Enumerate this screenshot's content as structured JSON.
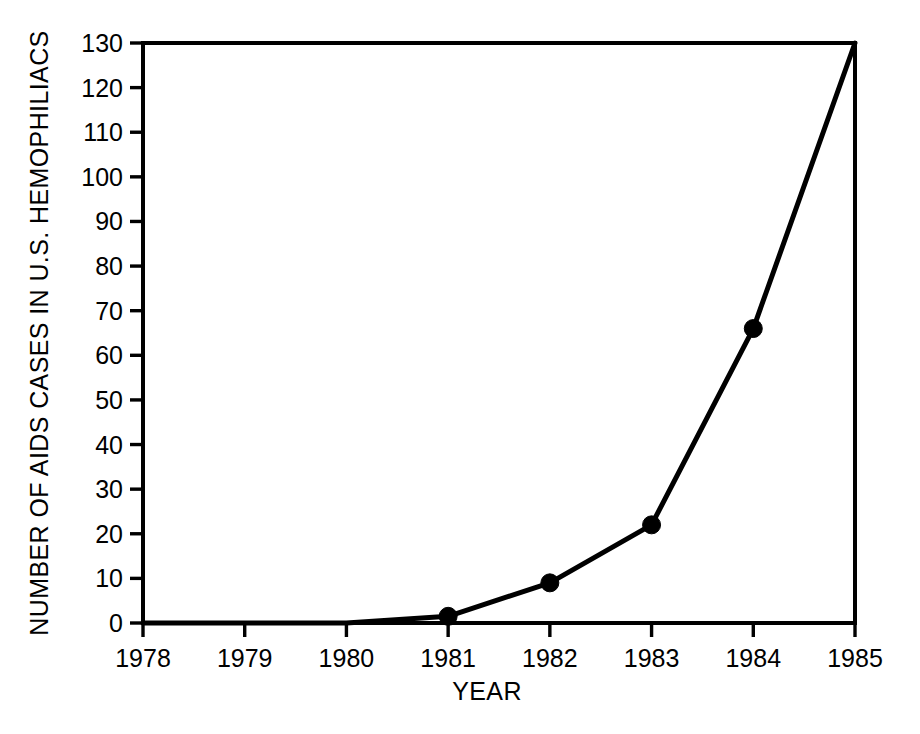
{
  "chart_data": {
    "type": "line",
    "title": "",
    "xlabel": "YEAR",
    "ylabel": "NUMBER OF AIDS CASES IN U.S. HEMOPHILIACS",
    "x": [
      1978,
      1979,
      1980,
      1981,
      1982,
      1983,
      1984,
      1985
    ],
    "values": [
      0,
      0,
      0,
      1.5,
      9,
      22,
      66,
      130
    ],
    "series": [
      {
        "name": "AIDS cases in U.S. hemophiliacs",
        "values": [
          0,
          0,
          0,
          1.5,
          9,
          22,
          66,
          130
        ]
      }
    ],
    "markers_at_x": [
      1981,
      1982,
      1983,
      1984
    ],
    "xlim": [
      1978,
      1985
    ],
    "ylim": [
      0,
      130
    ],
    "xticks": [
      1978,
      1979,
      1980,
      1981,
      1982,
      1983,
      1984,
      1985
    ],
    "yticks": [
      0,
      10,
      20,
      30,
      40,
      50,
      60,
      70,
      80,
      90,
      100,
      110,
      120,
      130
    ],
    "xtick_labels": [
      "1978",
      "1979",
      "1980",
      "1981",
      "1982",
      "1983",
      "1984",
      "1985"
    ],
    "ytick_labels": [
      "0",
      "10",
      "20",
      "30",
      "40",
      "50",
      "60",
      "70",
      "80",
      "90",
      "100",
      "110",
      "120",
      "130"
    ],
    "grid": false,
    "legend": "none",
    "line_color": "#000000",
    "marker_color": "#000000",
    "background_color": "#ffffff",
    "frame": "box"
  },
  "axes": {
    "y_title": "NUMBER OF AIDS CASES IN U.S. HEMOPHILIACS",
    "x_title": "YEAR"
  }
}
